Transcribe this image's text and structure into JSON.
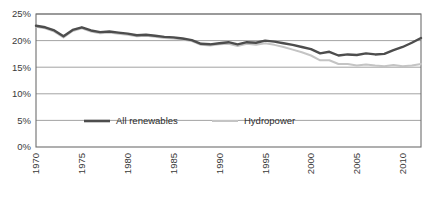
{
  "chart_data": {
    "type": "line",
    "title": "",
    "subtitle": "",
    "xlabel": "",
    "ylabel": "",
    "ylim": [
      0,
      25
    ],
    "yticks": [
      0,
      5,
      10,
      15,
      20,
      25
    ],
    "ytick_labels": [
      "0%",
      "5%",
      "10%",
      "15%",
      "20%",
      "25%"
    ],
    "xlim": [
      1970,
      2012
    ],
    "xticks": [
      1970,
      1975,
      1980,
      1985,
      1990,
      1995,
      2000,
      2005,
      2010
    ],
    "xtick_labels": [
      "1970",
      "1975",
      "1980",
      "1985",
      "1990",
      "1995",
      "2000",
      "2005",
      "2010"
    ],
    "xtick_rotation": 90,
    "grid": "horizontal",
    "legend_position": "inside-lower-left",
    "x": [
      1970,
      1971,
      1972,
      1973,
      1974,
      1975,
      1976,
      1977,
      1978,
      1979,
      1980,
      1981,
      1982,
      1983,
      1984,
      1985,
      1986,
      1987,
      1988,
      1989,
      1990,
      1991,
      1992,
      1993,
      1994,
      1995,
      1996,
      1997,
      1998,
      1999,
      2000,
      2001,
      2002,
      2003,
      2004,
      2005,
      2006,
      2007,
      2008,
      2009,
      2010,
      2011,
      2012
    ],
    "series": [
      {
        "name": "All renewables",
        "color": "#4d4d4d",
        "line_width": 2.4,
        "values": [
          22.8,
          22.5,
          21.9,
          20.8,
          22.0,
          22.5,
          21.9,
          21.6,
          21.7,
          21.5,
          21.3,
          21.0,
          21.1,
          20.9,
          20.7,
          20.6,
          20.4,
          20.1,
          19.4,
          19.3,
          19.5,
          19.7,
          19.3,
          19.7,
          19.6,
          20.0,
          19.8,
          19.5,
          19.2,
          18.8,
          18.4,
          17.6,
          17.9,
          17.2,
          17.4,
          17.3,
          17.6,
          17.4,
          17.5,
          18.2,
          18.8,
          19.6,
          20.5
        ]
      },
      {
        "name": "Hydropower",
        "color": "#c4c4c4",
        "line_width": 2.0,
        "values": [
          22.6,
          22.3,
          21.7,
          20.6,
          21.8,
          22.3,
          21.7,
          21.4,
          21.5,
          21.3,
          21.1,
          20.8,
          20.9,
          20.7,
          20.5,
          20.4,
          20.2,
          19.9,
          19.2,
          19.1,
          19.3,
          19.4,
          19.0,
          19.4,
          19.2,
          19.5,
          19.2,
          18.8,
          18.3,
          17.8,
          17.2,
          16.3,
          16.3,
          15.6,
          15.6,
          15.3,
          15.5,
          15.3,
          15.2,
          15.4,
          15.2,
          15.3,
          15.6
        ]
      }
    ],
    "legend": [
      {
        "label": "All renewables",
        "color": "#4d4d4d"
      },
      {
        "label": "Hydropower",
        "color": "#c4c4c4"
      }
    ],
    "plot_area": {
      "left": 36,
      "top": 14,
      "right": 421,
      "bottom": 147
    },
    "axis_color": "#6e6e6e",
    "grid_color": "#999999",
    "background": "#ffffff"
  }
}
